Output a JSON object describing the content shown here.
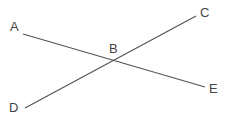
{
  "diagram": {
    "type": "intersecting-lines",
    "line_color": "#555555",
    "label_color": "#444444",
    "points": {
      "A": {
        "label": "A",
        "line_end": [
          23,
          34
        ],
        "label_pos": [
          10,
          31
        ]
      },
      "B": {
        "label": "B",
        "intersection": [
          116,
          61
        ],
        "label_pos": [
          109,
          53
        ]
      },
      "C": {
        "label": "C",
        "line_end": [
          196,
          16
        ],
        "label_pos": [
          200,
          17
        ]
      },
      "D": {
        "label": "D",
        "line_end": [
          25,
          108
        ],
        "label_pos": [
          9,
          112
        ]
      },
      "E": {
        "label": "E",
        "line_end": [
          205,
          87
        ],
        "label_pos": [
          209,
          93
        ]
      }
    },
    "segments": [
      {
        "name": "AE",
        "from": "A",
        "to": "E"
      },
      {
        "name": "DC",
        "from": "D",
        "to": "C"
      }
    ]
  }
}
